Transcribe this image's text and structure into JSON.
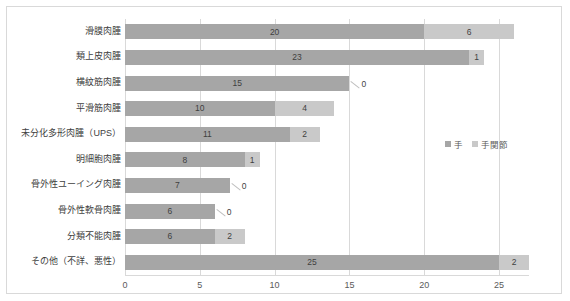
{
  "chart_data": {
    "type": "bar",
    "orientation": "horizontal",
    "stacked": true,
    "title": "",
    "xlabel": "",
    "ylabel": "",
    "xlim": [
      0,
      27
    ],
    "xticks": [
      0,
      5,
      10,
      15,
      20,
      25
    ],
    "xtick_labels": [
      "0",
      "5",
      "10",
      "15",
      "20",
      "25"
    ],
    "grid": true,
    "legend_position": "middle-right",
    "categories": [
      "滑膜肉腫",
      "類上皮肉腫",
      "横紋筋肉腫",
      "平滑筋肉腫",
      "未分化多形肉腫（UPS）",
      "明細胞肉腫",
      "骨外性ユーイング肉腫",
      "骨外性軟骨肉腫",
      "分類不能肉腫",
      "その他（不詳、悪性）"
    ],
    "series": [
      {
        "name": "手",
        "color": "#a6a6a6",
        "values": [
          20,
          23,
          15,
          10,
          11,
          8,
          7,
          6,
          6,
          25
        ]
      },
      {
        "name": "手関節",
        "color": "#c9c9c9",
        "values": [
          6,
          1,
          0,
          4,
          2,
          1,
          0,
          0,
          2,
          2
        ]
      }
    ],
    "value_labels": {
      "series_1": [
        "20",
        "23",
        "15",
        "10",
        "11",
        "8",
        "7",
        "6",
        "6",
        "25"
      ],
      "series_2": [
        "6",
        "1",
        "0",
        "4",
        "2",
        "1",
        "0",
        "0",
        "2",
        "2"
      ]
    }
  },
  "legend": {
    "items": [
      {
        "label": "手",
        "color": "#a6a6a6"
      },
      {
        "label": "手関節",
        "color": "#c9c9c9"
      }
    ]
  },
  "colors": {
    "series_1": "#a6a6a6",
    "series_2": "#c9c9c9",
    "gridline": "#d9d9d9",
    "border": "#d9d9d9",
    "text": "#404040",
    "tick_text": "#5a5a5a"
  }
}
